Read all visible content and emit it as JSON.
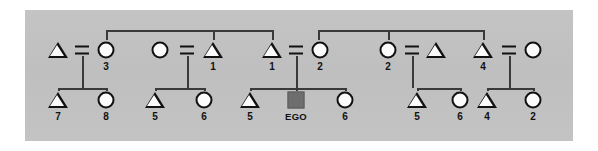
{
  "diagram": {
    "type": "kinship-chart",
    "title": "",
    "ego_label": "EGO",
    "background_color": "#c2c2c2",
    "page_color": "#ffffff",
    "ego_fill_color": "#6e6e6e",
    "line_color": "#3a3a3a",
    "symbol_stroke_color": "#111111",
    "symbol_fill_color": "#fbfbfb",
    "marriage_symbol": "=",
    "generations": [
      {
        "name": "parent-generation",
        "row": 0,
        "y": 50,
        "nodes": [
          {
            "id": "g0-n1",
            "shape": "triangle",
            "sex": "male",
            "label": "",
            "x": 58
          },
          {
            "id": "g0-n2",
            "shape": "circle",
            "sex": "female",
            "label": "3",
            "x": 106
          },
          {
            "id": "g0-n3",
            "shape": "circle",
            "sex": "female",
            "label": "",
            "x": 160
          },
          {
            "id": "g0-n4",
            "shape": "triangle",
            "sex": "male",
            "label": "1",
            "x": 213
          },
          {
            "id": "g0-n5",
            "shape": "triangle",
            "sex": "male",
            "label": "1",
            "x": 272
          },
          {
            "id": "g0-n6",
            "shape": "circle",
            "sex": "female",
            "label": "2",
            "x": 320
          },
          {
            "id": "g0-n7",
            "shape": "circle",
            "sex": "female",
            "label": "2",
            "x": 388
          },
          {
            "id": "g0-n8",
            "shape": "triangle",
            "sex": "male",
            "label": "",
            "x": 436
          },
          {
            "id": "g0-n9",
            "shape": "triangle",
            "sex": "male",
            "label": "4",
            "x": 483
          },
          {
            "id": "g0-n10",
            "shape": "circle",
            "sex": "female",
            "label": "",
            "x": 533
          }
        ]
      },
      {
        "name": "ego-generation",
        "row": 1,
        "y": 100,
        "nodes": [
          {
            "id": "g1-n1",
            "shape": "triangle",
            "sex": "male",
            "label": "7",
            "x": 58
          },
          {
            "id": "g1-n2",
            "shape": "circle",
            "sex": "female",
            "label": "8",
            "x": 106
          },
          {
            "id": "g1-n3",
            "shape": "triangle",
            "sex": "male",
            "label": "5",
            "x": 155
          },
          {
            "id": "g1-n4",
            "shape": "circle",
            "sex": "female",
            "label": "6",
            "x": 204
          },
          {
            "id": "g1-n5",
            "shape": "triangle",
            "sex": "male",
            "label": "5",
            "x": 250
          },
          {
            "id": "g1-n6",
            "shape": "square",
            "sex": "ego",
            "label": "EGO",
            "x": 296
          },
          {
            "id": "g1-n7",
            "shape": "circle",
            "sex": "female",
            "label": "6",
            "x": 345
          },
          {
            "id": "g1-n8",
            "shape": "triangle",
            "sex": "male",
            "label": "5",
            "x": 417
          },
          {
            "id": "g1-n9",
            "shape": "circle",
            "sex": "female",
            "label": "6",
            "x": 460
          },
          {
            "id": "g1-n10",
            "shape": "triangle",
            "sex": "male",
            "label": "4",
            "x": 487
          },
          {
            "id": "g1-n11",
            "shape": "circle",
            "sex": "female",
            "label": "2",
            "x": 533
          }
        ]
      }
    ],
    "marriages": [
      {
        "id": "m1",
        "left": "g0-n1",
        "right": "g0-n2",
        "eq_x": 82,
        "eq_y": 50,
        "drop_x": 82,
        "children": [
          "g1-n1",
          "g1-n2"
        ]
      },
      {
        "id": "m2",
        "left": "g0-n3",
        "right": "g0-n4",
        "eq_x": 187,
        "eq_y": 50,
        "drop_x": 187,
        "children": [
          "g1-n3",
          "g1-n4"
        ]
      },
      {
        "id": "m3",
        "left": "g0-n5",
        "right": "g0-n6",
        "eq_x": 296,
        "eq_y": 50,
        "drop_x": 296,
        "children": [
          "g1-n5",
          "g1-n6",
          "g1-n7"
        ]
      },
      {
        "id": "m4",
        "left": "g0-n7",
        "right": "g0-n8",
        "eq_x": 412,
        "eq_y": 50,
        "drop_x": 412,
        "children": [
          "g1-n8",
          "g1-n9"
        ]
      },
      {
        "id": "m5",
        "left": "g0-n9",
        "right": "g0-n10",
        "eq_x": 509,
        "eq_y": 50,
        "drop_x": 509,
        "children": [
          "g1-n10",
          "g1-n11"
        ]
      }
    ],
    "sibling_links": [
      {
        "id": "s-top-1",
        "y": 30,
        "x1": 106,
        "x2": 272,
        "drops": [
          106,
          213,
          272
        ]
      },
      {
        "id": "s-top-2",
        "y": 30,
        "x1": 318,
        "x2": 483,
        "drops": [
          318,
          388,
          483
        ]
      }
    ],
    "legend": {
      "triangle": "male",
      "circle": "female",
      "filled-square": "ego",
      "equals": "marriage"
    }
  }
}
